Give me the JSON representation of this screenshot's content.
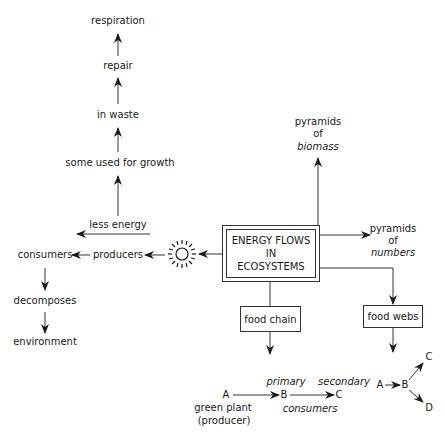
{
  "diagram": {
    "central_node": {
      "lines": [
        "ENERGY FLOWS",
        "IN",
        "ECOSYSTEMS"
      ]
    },
    "left_branch": {
      "sun_icon": "sun-icon",
      "producers": "producers",
      "consumers": "consumers",
      "decomposes": "decomposes",
      "environment": "environment",
      "less_energy": "less energy",
      "some_used_for_growth": "some used for growth",
      "in_waste": "in waste",
      "repair": "repair",
      "respiration": "respiration"
    },
    "pyramids_biomass": {
      "line1": "pyramids",
      "line2": "of",
      "line3": "biomass"
    },
    "pyramids_numbers": {
      "line1": "pyramids",
      "line2": "of",
      "line3": "numbers"
    },
    "food_chain": {
      "label": "food chain",
      "a": "A",
      "b": "B",
      "c": "C",
      "primary": "primary",
      "secondary": "secondary",
      "consumers": "consumers",
      "green_plant": "green plant",
      "producer": "(producer)"
    },
    "food_webs": {
      "label": "food webs",
      "a": "A",
      "b": "B",
      "c": "C",
      "d": "D"
    },
    "colors": {
      "line": "#333333",
      "text": "#1a1a1a",
      "background": "#ffffff"
    }
  }
}
